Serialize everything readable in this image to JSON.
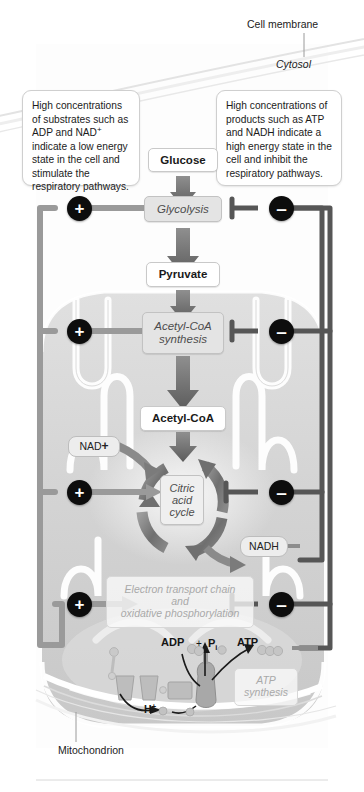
{
  "figure": {
    "type": "biological-pathway-diagram"
  },
  "labels": {
    "cell_membrane": "Cell membrane",
    "cytosol": "Cytosol",
    "mitochondrion": "Mitochondrion"
  },
  "callouts": {
    "left": {
      "id": "stimulation-callout",
      "line1": "High concentrations",
      "line2": "of substrates such as",
      "line3_pre": "ADP and NAD",
      "line3_sup": "+",
      "line4": "indicate a low energy",
      "line5": "state in the cell and",
      "line6": "stimulate the",
      "line7": "respiratory pathways."
    },
    "right": {
      "id": "inhibition-callout",
      "line1": "High concentrations of",
      "line2": "products such as ATP",
      "line3": "and NADH indicate a",
      "line4": "high energy state in the",
      "line5": "cell and inhibit the",
      "line6": "respiratory pathways."
    }
  },
  "pathway": {
    "glucose": "Glucose",
    "glycolysis": "Glycolysis",
    "pyruvate": "Pyruvate",
    "acetyl_coa_synthesis_line1": "Acetyl-CoA",
    "acetyl_coa_synthesis_line2": "synthesis",
    "acetyl_coa": "Acetyl-CoA",
    "citric_acid_cycle_line1": "Citric",
    "citric_acid_cycle_line2": "acid",
    "citric_acid_cycle_line3": "cycle",
    "etc_line1": "Electron transport chain",
    "etc_line2": "and",
    "etc_line3": "oxidative phosphorylation",
    "atp_synthesis_line1": "ATP",
    "atp_synthesis_line2": "synthesis"
  },
  "metabolites": {
    "nad_plus_base": "NAD",
    "nad_plus_sup": "+",
    "nadh": "NADH",
    "adp": "ADP",
    "plus_sign": "+",
    "pi_base": "P",
    "pi_sub": "i",
    "atp": "ATP",
    "proton_base": "H",
    "proton_sup": "+"
  },
  "regulators": {
    "stimulate_symbol": "+",
    "inhibit_symbol": "–",
    "stimulate_name": "stimulation",
    "inhibit_name": "inhibition",
    "rows": [
      {
        "target": "glycolysis",
        "plus": "+",
        "minus": "–"
      },
      {
        "target": "acetyl-coa-synthesis",
        "plus": "+",
        "minus": "–"
      },
      {
        "target": "citric-acid-cycle",
        "plus": "+",
        "minus": "–"
      },
      {
        "target": "electron-transport-chain",
        "plus": "+",
        "minus": "–"
      }
    ]
  },
  "colors": {
    "arrow_dark": "#5e5e5e",
    "regulator_fill": "#0d0d0d",
    "stimulate_line": "#9a9a9a",
    "inhibit_line": "#565656",
    "mitochondrion_fill": "#d2d2d2",
    "cytosol_fill": "#fbfbfb",
    "box_border": "#c9c9c9"
  }
}
